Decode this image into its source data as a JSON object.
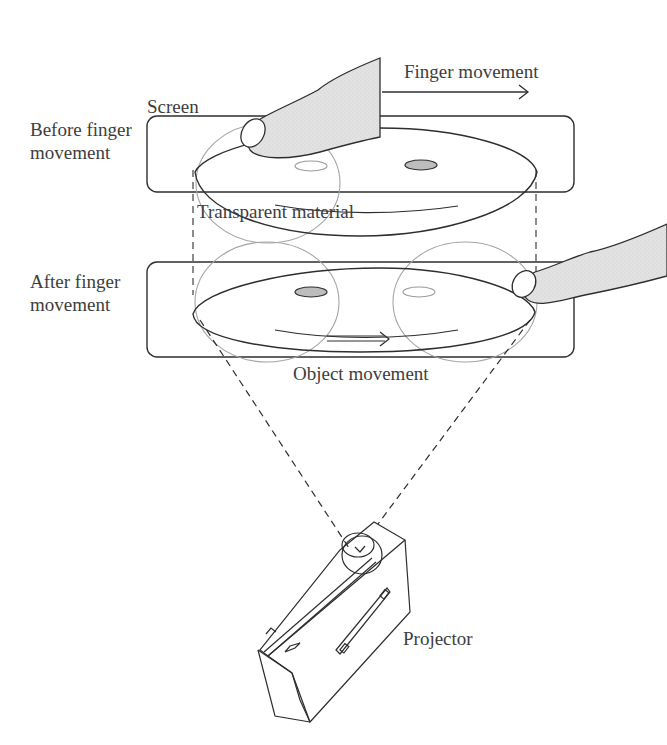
{
  "diagram": {
    "type": "schematic",
    "labels": {
      "screen": "Screen",
      "finger_movement": "Finger movement",
      "before_line1": "Before finger",
      "before_line2": "movement",
      "transparent_material": "Transparent material",
      "after_line1": "After finger",
      "after_line2": "movement",
      "object_movement": "Object movement",
      "projector": "Projector"
    },
    "panels": [
      {
        "name": "before",
        "state": "finger on left, object on right"
      },
      {
        "name": "after",
        "state": "finger on right, object moved"
      }
    ],
    "colors": {
      "line": "#2e2e2e",
      "faint_line": "#9a9a9a",
      "finger_fill": "#e4e4e4",
      "object_fill": "#bdbdbd"
    }
  }
}
